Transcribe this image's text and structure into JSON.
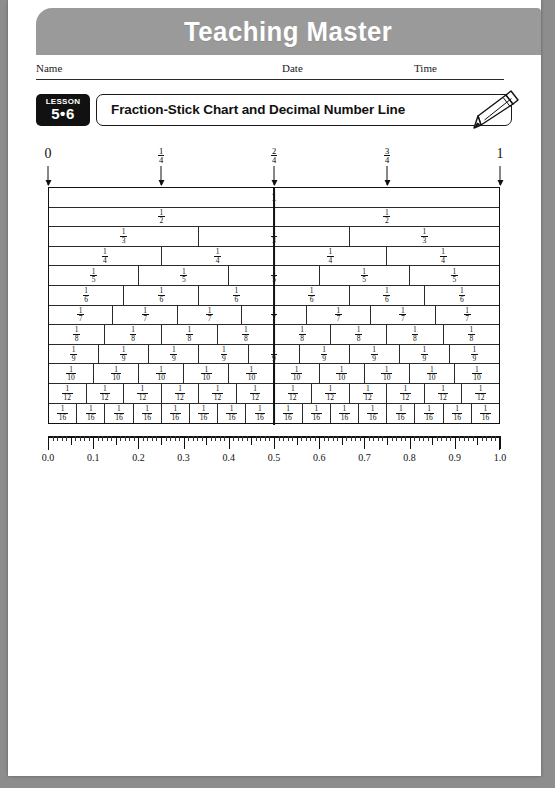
{
  "banner": {
    "title": "Teaching Master",
    "background_color": "#9a9a9a",
    "text_color": "#ffffff"
  },
  "name_line": {
    "name_label": "Name",
    "date_label": "Date",
    "time_label": "Time"
  },
  "lesson": {
    "word": "LESSON",
    "number": "5•6",
    "title": "Fraction-Stick Chart and Decimal Number Line",
    "pencil_icon": "pencil-icon"
  },
  "chart_data": {
    "type": "table",
    "title": "Fraction-Stick Chart",
    "top_markers": [
      {
        "value": 0.0,
        "text": "0",
        "is_fraction": false
      },
      {
        "value": 0.25,
        "numerator": "1",
        "denominator": "4",
        "is_fraction": true
      },
      {
        "value": 0.5,
        "numerator": "2",
        "denominator": "4",
        "is_fraction": true
      },
      {
        "value": 0.75,
        "numerator": "3",
        "denominator": "4",
        "is_fraction": true
      },
      {
        "value": 1.0,
        "text": "1",
        "is_fraction": false
      }
    ],
    "rows": [
      {
        "denominator": 1,
        "cells": 1,
        "label_whole": "1"
      },
      {
        "denominator": 2,
        "cells": 2,
        "numerator": "1"
      },
      {
        "denominator": 3,
        "cells": 3,
        "numerator": "1"
      },
      {
        "denominator": 4,
        "cells": 4,
        "numerator": "1"
      },
      {
        "denominator": 5,
        "cells": 5,
        "numerator": "1"
      },
      {
        "denominator": 6,
        "cells": 6,
        "numerator": "1"
      },
      {
        "denominator": 7,
        "cells": 7,
        "numerator": "1"
      },
      {
        "denominator": 8,
        "cells": 8,
        "numerator": "1"
      },
      {
        "denominator": 9,
        "cells": 9,
        "numerator": "1"
      },
      {
        "denominator": 10,
        "cells": 10,
        "numerator": "1"
      },
      {
        "denominator": 12,
        "cells": 12,
        "numerator": "1"
      },
      {
        "denominator": 16,
        "cells": 16,
        "numerator": "1"
      }
    ],
    "number_line": {
      "min": 0.0,
      "max": 1.0,
      "labels": [
        "0.0",
        "0.1",
        "0.2",
        "0.3",
        "0.4",
        "0.5",
        "0.6",
        "0.7",
        "0.8",
        "0.9",
        "1.0"
      ],
      "major_tick_step": 0.1,
      "mid_tick_step": 0.05,
      "minor_tick_step": 0.01
    }
  }
}
